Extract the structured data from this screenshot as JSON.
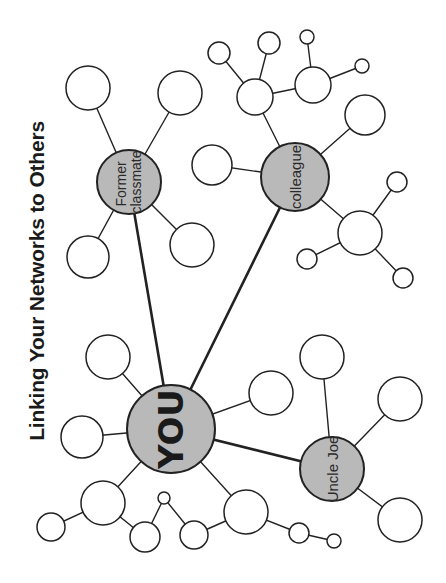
{
  "title": "Linking Your Networks to Others",
  "colors": {
    "hub_fill": "#b9b9b9",
    "leaf_fill": "#ffffff",
    "stroke": "#222222",
    "background": "#ffffff"
  },
  "hubs": {
    "you": {
      "label": "YOU",
      "cx": 171,
      "cy": 429,
      "r": 44
    },
    "former_classmate": {
      "label_line1": "Former",
      "label_line2": "classmate",
      "cx": 129,
      "cy": 182,
      "r": 32
    },
    "colleague": {
      "label": "colleague",
      "cx": 295,
      "cy": 177,
      "r": 34
    },
    "uncle_joe": {
      "label": "Uncle Joe",
      "cx": 332,
      "cy": 469,
      "r": 32
    }
  },
  "leaf_nodes": [
    {
      "id": "fc-1",
      "cx": 88,
      "cy": 88,
      "r": 22
    },
    {
      "id": "fc-2",
      "cx": 180,
      "cy": 93,
      "r": 22
    },
    {
      "id": "fc-3",
      "cx": 88,
      "cy": 257,
      "r": 21
    },
    {
      "id": "fc-4",
      "cx": 192,
      "cy": 245,
      "r": 22
    },
    {
      "id": "co-1",
      "cx": 212,
      "cy": 165,
      "r": 20
    },
    {
      "id": "co-2",
      "cx": 255,
      "cy": 97,
      "r": 18
    },
    {
      "id": "co-3",
      "cx": 219,
      "cy": 53,
      "r": 11
    },
    {
      "id": "co-4",
      "cx": 269,
      "cy": 43,
      "r": 11
    },
    {
      "id": "co-5",
      "cx": 313,
      "cy": 85,
      "r": 18
    },
    {
      "id": "co-6",
      "cx": 307,
      "cy": 37,
      "r": 7
    },
    {
      "id": "co-7",
      "cx": 362,
      "cy": 66,
      "r": 7
    },
    {
      "id": "co-8",
      "cx": 365,
      "cy": 115,
      "r": 20
    },
    {
      "id": "co-9",
      "cx": 360,
      "cy": 233,
      "r": 22
    },
    {
      "id": "co-10",
      "cx": 397,
      "cy": 182,
      "r": 10
    },
    {
      "id": "co-11",
      "cx": 403,
      "cy": 278,
      "r": 10
    },
    {
      "id": "co-12",
      "cx": 307,
      "cy": 259,
      "r": 10
    },
    {
      "id": "you-1",
      "cx": 108,
      "cy": 357,
      "r": 22
    },
    {
      "id": "you-2",
      "cx": 82,
      "cy": 437,
      "r": 21
    },
    {
      "id": "you-3",
      "cx": 271,
      "cy": 393,
      "r": 22
    },
    {
      "id": "you-4",
      "cx": 103,
      "cy": 503,
      "r": 22
    },
    {
      "id": "you-5",
      "cx": 51,
      "cy": 527,
      "r": 14
    },
    {
      "id": "you-6",
      "cx": 145,
      "cy": 537,
      "r": 15
    },
    {
      "id": "you-7",
      "cx": 164,
      "cy": 498,
      "r": 6
    },
    {
      "id": "you-8",
      "cx": 194,
      "cy": 535,
      "r": 14
    },
    {
      "id": "you-9",
      "cx": 246,
      "cy": 512,
      "r": 22
    },
    {
      "id": "you-10",
      "cx": 299,
      "cy": 533,
      "r": 10
    },
    {
      "id": "you-11",
      "cx": 334,
      "cy": 541,
      "r": 7
    },
    {
      "id": "uj-1",
      "cx": 322,
      "cy": 357,
      "r": 22
    },
    {
      "id": "uj-2",
      "cx": 400,
      "cy": 399,
      "r": 22
    },
    {
      "id": "uj-3",
      "cx": 400,
      "cy": 520,
      "r": 22
    }
  ],
  "thick_links": [
    {
      "from": "you",
      "to": "former_classmate"
    },
    {
      "from": "you",
      "to": "colleague"
    },
    {
      "from": "you",
      "to": "uncle_joe"
    }
  ],
  "thin_links": [
    {
      "from": "former_classmate",
      "to": "fc-1"
    },
    {
      "from": "former_classmate",
      "to": "fc-2"
    },
    {
      "from": "former_classmate",
      "to": "fc-3"
    },
    {
      "from": "former_classmate",
      "to": "fc-4"
    },
    {
      "from": "colleague",
      "to": "co-1"
    },
    {
      "from": "colleague",
      "to": "co-2"
    },
    {
      "from": "co-2",
      "to": "co-3"
    },
    {
      "from": "co-2",
      "to": "co-4"
    },
    {
      "from": "co-2",
      "to": "co-5"
    },
    {
      "from": "co-5",
      "to": "co-6"
    },
    {
      "from": "co-5",
      "to": "co-7"
    },
    {
      "from": "colleague",
      "to": "co-8"
    },
    {
      "from": "colleague",
      "to": "co-9"
    },
    {
      "from": "co-9",
      "to": "co-10"
    },
    {
      "from": "co-9",
      "to": "co-11"
    },
    {
      "from": "co-9",
      "to": "co-12"
    },
    {
      "from": "you",
      "to": "you-1"
    },
    {
      "from": "you",
      "to": "you-2"
    },
    {
      "from": "you",
      "to": "you-3"
    },
    {
      "from": "you",
      "to": "you-4"
    },
    {
      "from": "you-4",
      "to": "you-5"
    },
    {
      "from": "you-4",
      "to": "you-6"
    },
    {
      "from": "you-6",
      "to": "you-7"
    },
    {
      "from": "you-7",
      "to": "you-8"
    },
    {
      "from": "you-8",
      "to": "you-9"
    },
    {
      "from": "you",
      "to": "you-9"
    },
    {
      "from": "you-9",
      "to": "you-10"
    },
    {
      "from": "you-10",
      "to": "you-11"
    },
    {
      "from": "uncle_joe",
      "to": "uj-1"
    },
    {
      "from": "uncle_joe",
      "to": "uj-2"
    },
    {
      "from": "uncle_joe",
      "to": "uj-3"
    }
  ]
}
